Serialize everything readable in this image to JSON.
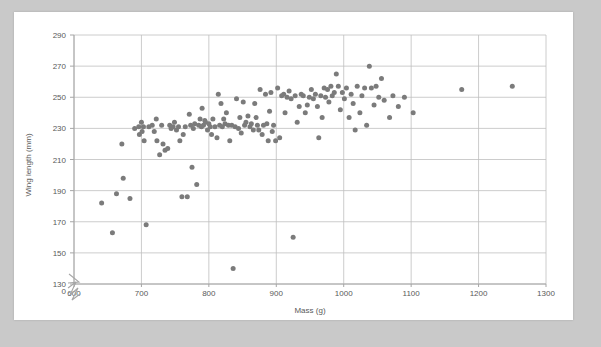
{
  "page": {
    "background_color": "#c9c9c9",
    "paper_color": "#ffffff"
  },
  "chart_data": {
    "type": "scatter",
    "title": "",
    "xlabel": "Mass (g)",
    "ylabel": "Wing length (mm)",
    "xlim": [
      600,
      1300
    ],
    "ylim": [
      130,
      290
    ],
    "y_axis_break": true,
    "y_break_label": "0",
    "xticks": [
      600,
      700,
      800,
      900,
      1000,
      1100,
      1200,
      1300
    ],
    "yticks": [
      130,
      150,
      170,
      190,
      210,
      230,
      250,
      270,
      290
    ],
    "grid": true,
    "legend": "none",
    "marker_color": "#7b7b7b",
    "marker_size": 5,
    "series": [
      {
        "name": "birds",
        "points": [
          [
            641,
            182
          ],
          [
            657,
            163
          ],
          [
            663,
            188
          ],
          [
            671,
            220
          ],
          [
            673,
            198
          ],
          [
            683,
            185
          ],
          [
            690,
            230
          ],
          [
            696,
            231
          ],
          [
            697,
            226
          ],
          [
            700,
            234
          ],
          [
            701,
            228
          ],
          [
            703,
            231
          ],
          [
            704,
            222
          ],
          [
            707,
            168
          ],
          [
            711,
            231
          ],
          [
            716,
            232
          ],
          [
            719,
            228
          ],
          [
            722,
            236
          ],
          [
            723,
            222
          ],
          [
            727,
            213
          ],
          [
            730,
            232
          ],
          [
            732,
            220
          ],
          [
            735,
            216
          ],
          [
            739,
            217
          ],
          [
            742,
            232
          ],
          [
            744,
            230
          ],
          [
            747,
            231
          ],
          [
            749,
            234
          ],
          [
            752,
            229
          ],
          [
            755,
            231
          ],
          [
            757,
            222
          ],
          [
            760,
            186
          ],
          [
            762,
            226
          ],
          [
            765,
            231
          ],
          [
            768,
            186
          ],
          [
            771,
            239
          ],
          [
            773,
            232
          ],
          [
            775,
            205
          ],
          [
            777,
            230
          ],
          [
            779,
            233
          ],
          [
            782,
            194
          ],
          [
            785,
            232
          ],
          [
            787,
            236
          ],
          [
            789,
            231
          ],
          [
            790,
            243
          ],
          [
            792,
            232
          ],
          [
            794,
            235
          ],
          [
            795,
            234
          ],
          [
            798,
            229
          ],
          [
            800,
            233
          ],
          [
            802,
            231
          ],
          [
            804,
            226
          ],
          [
            806,
            236
          ],
          [
            809,
            231
          ],
          [
            812,
            224
          ],
          [
            814,
            252
          ],
          [
            816,
            232
          ],
          [
            818,
            246
          ],
          [
            820,
            231
          ],
          [
            822,
            236
          ],
          [
            824,
            233
          ],
          [
            826,
            240
          ],
          [
            829,
            232
          ],
          [
            831,
            222
          ],
          [
            834,
            232
          ],
          [
            836,
            140
          ],
          [
            839,
            231
          ],
          [
            841,
            249
          ],
          [
            844,
            230
          ],
          [
            846,
            237
          ],
          [
            848,
            227
          ],
          [
            851,
            247
          ],
          [
            853,
            232
          ],
          [
            855,
            234
          ],
          [
            858,
            238
          ],
          [
            861,
            231
          ],
          [
            863,
            233
          ],
          [
            866,
            229
          ],
          [
            868,
            246
          ],
          [
            870,
            237
          ],
          [
            872,
            232
          ],
          [
            874,
            229
          ],
          [
            876,
            255
          ],
          [
            879,
            226
          ],
          [
            881,
            232
          ],
          [
            884,
            252
          ],
          [
            886,
            233
          ],
          [
            888,
            222
          ],
          [
            890,
            241
          ],
          [
            892,
            253
          ],
          [
            894,
            228
          ],
          [
            896,
            232
          ],
          [
            899,
            222
          ],
          [
            902,
            256
          ],
          [
            905,
            224
          ],
          [
            908,
            251
          ],
          [
            911,
            252
          ],
          [
            913,
            240
          ],
          [
            916,
            250
          ],
          [
            919,
            254
          ],
          [
            922,
            249
          ],
          [
            925,
            160
          ],
          [
            928,
            251
          ],
          [
            931,
            234
          ],
          [
            934,
            244
          ],
          [
            937,
            252
          ],
          [
            940,
            251
          ],
          [
            943,
            240
          ],
          [
            946,
            245
          ],
          [
            949,
            250
          ],
          [
            952,
            255
          ],
          [
            955,
            249
          ],
          [
            958,
            252
          ],
          [
            961,
            244
          ],
          [
            963,
            224
          ],
          [
            966,
            251
          ],
          [
            968,
            237
          ],
          [
            971,
            256
          ],
          [
            973,
            250
          ],
          [
            976,
            255
          ],
          [
            978,
            247
          ],
          [
            981,
            257
          ],
          [
            983,
            251
          ],
          [
            986,
            253
          ],
          [
            989,
            265
          ],
          [
            992,
            257
          ],
          [
            995,
            242
          ],
          [
            998,
            253
          ],
          [
            1001,
            249
          ],
          [
            1004,
            256
          ],
          [
            1008,
            237
          ],
          [
            1011,
            252
          ],
          [
            1014,
            246
          ],
          [
            1017,
            229
          ],
          [
            1020,
            257
          ],
          [
            1024,
            240
          ],
          [
            1027,
            251
          ],
          [
            1031,
            256
          ],
          [
            1034,
            232
          ],
          [
            1038,
            270
          ],
          [
            1041,
            256
          ],
          [
            1045,
            245
          ],
          [
            1048,
            257
          ],
          [
            1052,
            250
          ],
          [
            1056,
            262
          ],
          [
            1060,
            248
          ],
          [
            1068,
            237
          ],
          [
            1073,
            251
          ],
          [
            1081,
            244
          ],
          [
            1090,
            250
          ],
          [
            1103,
            240
          ],
          [
            1175,
            255
          ],
          [
            1250,
            257
          ]
        ]
      }
    ]
  }
}
